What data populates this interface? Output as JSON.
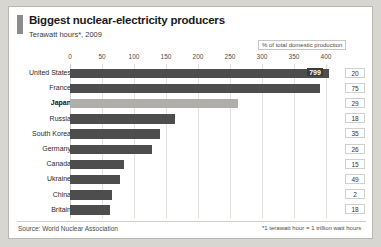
{
  "header": {
    "title": "Biggest nuclear-electricity producers",
    "subtitle": "Terawatt hours*, 2009",
    "legend_note": "% of total domestic production"
  },
  "footer": {
    "source": "Source: World Nuclear Association",
    "footnote": "*1 terawatt hour = 1 trillion watt hours"
  },
  "colors": {
    "bar": "#4d4d4d",
    "bar_highlight": "#b0aeab",
    "value_badge": "#3a3a3a",
    "grid": "#e3e1dc",
    "page_background": "#d8d6d1",
    "panel_background": "#ffffff",
    "accent": "#8c8c8c"
  },
  "chart_data": {
    "type": "bar",
    "orientation": "horizontal",
    "title": "Biggest nuclear-electricity producers",
    "subtitle": "Terawatt hours*, 2009",
    "xlabel": "",
    "ylabel": "",
    "xlim": [
      0,
      420
    ],
    "xticks": [
      0,
      50,
      100,
      150,
      200,
      250,
      300,
      350,
      400
    ],
    "grid": true,
    "legend": "% of total domestic production",
    "legend_position": "top-right",
    "axis_broken": true,
    "note": "United States bar is truncated at the axis end; its true value 799 is shown as a data label",
    "categories": [
      "United States",
      "France",
      "Japan",
      "Russia",
      "South Korea",
      "Germany",
      "Canada",
      "Ukraine",
      "China",
      "Britain"
    ],
    "values": [
      799,
      390,
      263,
      164,
      141,
      128,
      85,
      78,
      66,
      63
    ],
    "data_labels": [
      "799",
      "",
      "",
      "",
      "",
      "",
      "",
      "",
      "",
      ""
    ],
    "highlight_category": "Japan",
    "secondary_series": {
      "name": "% of total domestic production",
      "values": [
        20,
        75,
        29,
        18,
        35,
        26,
        15,
        49,
        2,
        18
      ]
    }
  }
}
